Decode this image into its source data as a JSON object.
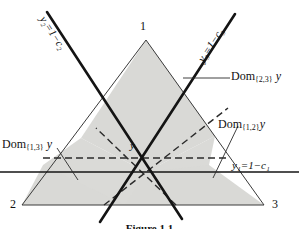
{
  "figure": {
    "caption": "Figure 1.1",
    "vertices": [
      {
        "name": "vertex-1",
        "label": "1",
        "x": 146,
        "y": 32
      },
      {
        "name": "vertex-2",
        "label": "2",
        "x": 22,
        "y": 205
      },
      {
        "name": "vertex-3",
        "label": "3",
        "x": 264,
        "y": 205
      }
    ],
    "center_point_label": "y",
    "line_labels": {
      "left_oblique": "y₂=1−c₂",
      "right_oblique": "y₃=1−c₃",
      "horizontal": "y₁=1−c₁"
    },
    "region_labels": [
      {
        "name": "dom-2-3",
        "prefix": "Dom",
        "sub": "{2,3}",
        "suffix": "y"
      },
      {
        "name": "dom-1-2",
        "prefix": "Dom",
        "sub": "{1,2}",
        "suffix": "y"
      },
      {
        "name": "dom-1-3",
        "prefix": "Dom",
        "sub": "{1,3}",
        "suffix": "y"
      }
    ],
    "colors": {
      "shade": "#d9d9d6",
      "stroke": "#1a1a1a",
      "thin_stroke": "#3a3a3a",
      "background": "#ffffff"
    }
  }
}
